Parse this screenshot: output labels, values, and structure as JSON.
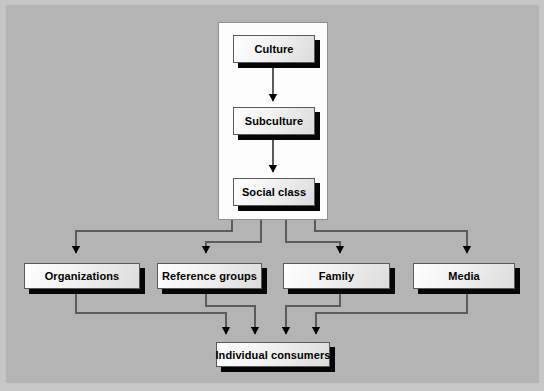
{
  "diagram": {
    "type": "hierarchy-flowchart",
    "background_color": "#b4b4b4",
    "panel_color": "#fdfdfd",
    "box_fill_color": "#f2f2f2",
    "box_border_color": "#5a5a5a",
    "shadow_color": "#050505",
    "connector_color": "#4a4a4a",
    "nodes": {
      "culture": "Culture",
      "subculture": "Subculture",
      "social_class": "Social class",
      "organizations": "Organizations",
      "reference_groups": "Reference groups",
      "family": "Family",
      "media": "Media",
      "individual_consumers": "Individual consumers"
    },
    "levels": [
      {
        "name": "cultural-chain",
        "items": [
          "Culture",
          "Subculture",
          "Social class"
        ]
      },
      {
        "name": "influencers",
        "items": [
          "Organizations",
          "Reference groups",
          "Family",
          "Media"
        ]
      },
      {
        "name": "outcome",
        "items": [
          "Individual consumers"
        ]
      }
    ],
    "edges": [
      {
        "from": "Culture",
        "to": "Subculture"
      },
      {
        "from": "Subculture",
        "to": "Social class"
      },
      {
        "from": "cultural-chain",
        "to": "Organizations"
      },
      {
        "from": "cultural-chain",
        "to": "Reference groups"
      },
      {
        "from": "cultural-chain",
        "to": "Family"
      },
      {
        "from": "cultural-chain",
        "to": "Media"
      },
      {
        "from": "Organizations",
        "to": "Individual consumers"
      },
      {
        "from": "Reference groups",
        "to": "Individual consumers"
      },
      {
        "from": "Family",
        "to": "Individual consumers"
      },
      {
        "from": "Media",
        "to": "Individual consumers"
      }
    ]
  }
}
